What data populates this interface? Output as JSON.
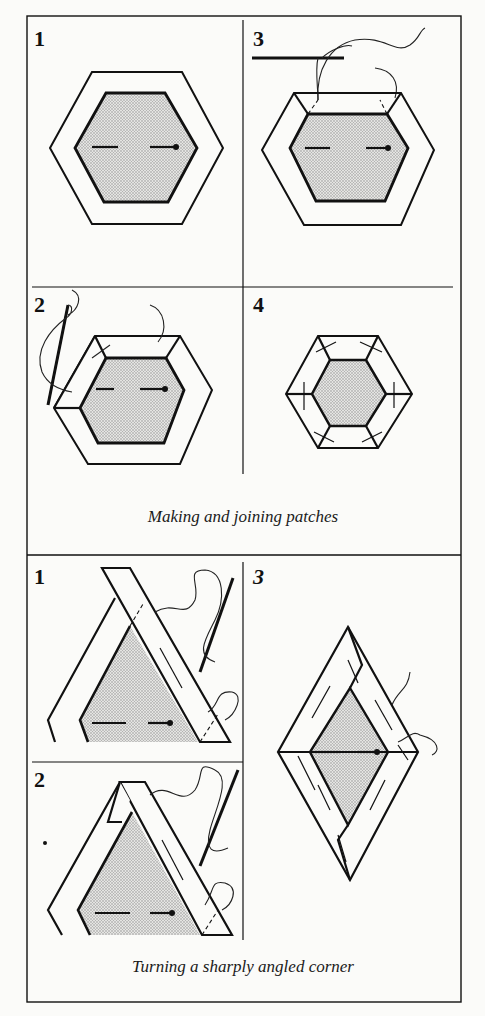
{
  "figure": {
    "section_top": {
      "caption": "Making and joining patches",
      "panels": [
        {
          "label": "1",
          "description": "Hexagon paper template pinned to fabric with seam allowance"
        },
        {
          "label": "2",
          "description": "Folding seam allowance over template and tacking with needle and thread"
        },
        {
          "label": "3",
          "description": "Tacking the next side with needle"
        },
        {
          "label": "4",
          "description": "Completed hexagon patch with all sides tacked"
        }
      ]
    },
    "section_bottom": {
      "caption": "Turning a sharply angled corner",
      "panels": [
        {
          "label": "1",
          "description": "Folding first side of triangle point"
        },
        {
          "label": "2",
          "description": "Folding corner flap at sharp point"
        },
        {
          "label": "3",
          "description": "Completed diamond patch tacked"
        }
      ]
    },
    "colors": {
      "background": "#fbfbf9",
      "ink": "#111111",
      "shading": "#b8b8b8"
    }
  }
}
